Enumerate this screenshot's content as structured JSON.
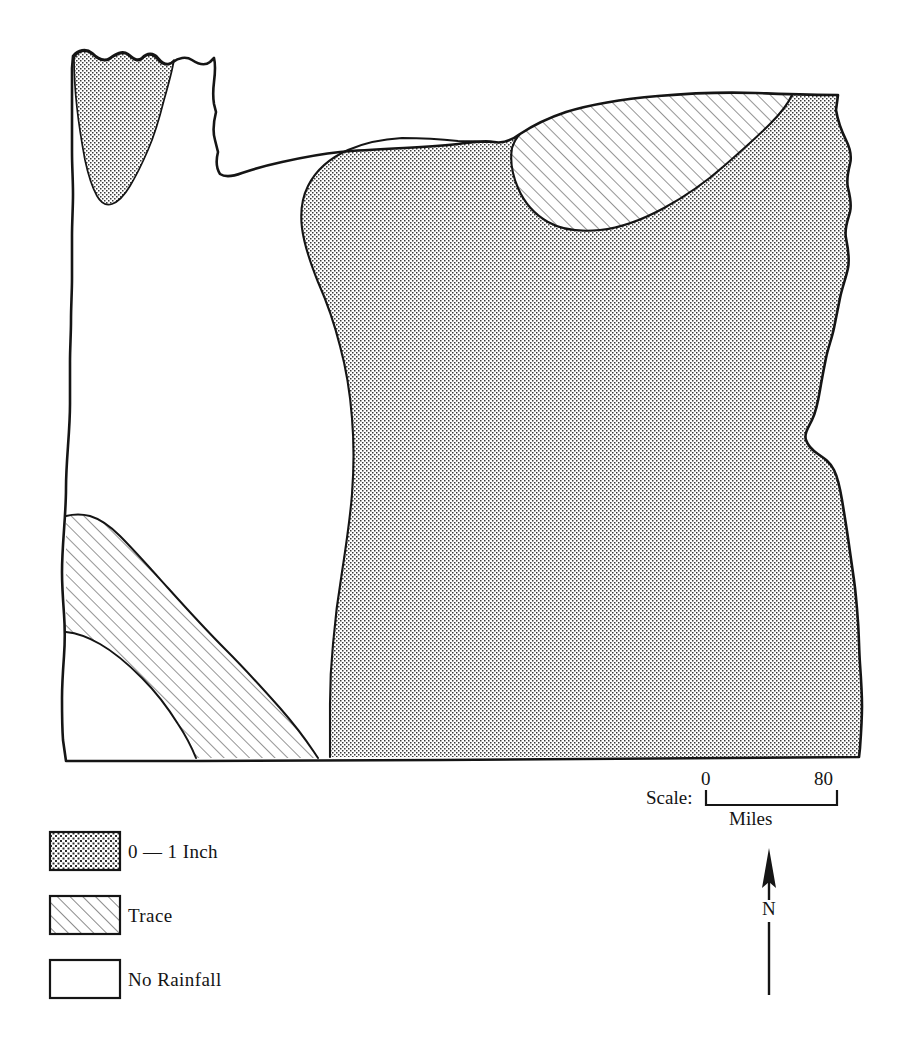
{
  "map": {
    "title": "Oregon Rainfall Distribution Map",
    "region_name": "Oregon",
    "outline_color": "#151515",
    "background_color": "#ffffff",
    "regions": [
      {
        "name": "northwest-coastal-stipple",
        "class_label": "0 — 1 Inch",
        "pattern": "stipple"
      },
      {
        "name": "eastern-oregon-stipple",
        "class_label": "0 — 1 Inch",
        "pattern": "stipple"
      },
      {
        "name": "northeast-trace-lens",
        "class_label": "Trace",
        "pattern": "hatch"
      },
      {
        "name": "southwest-trace-band",
        "class_label": "Trace",
        "pattern": "hatch"
      },
      {
        "name": "western-valley-no-rainfall",
        "class_label": "No Rainfall",
        "pattern": "blank"
      }
    ]
  },
  "legend": {
    "items": [
      {
        "label": "0 — 1 Inch",
        "pattern": "stipple"
      },
      {
        "label": "Trace",
        "pattern": "hatch"
      },
      {
        "label": "No Rainfall",
        "pattern": "blank"
      }
    ]
  },
  "scale": {
    "prefix": "Scale:",
    "min_label": "0",
    "max_label": "80",
    "units": "Miles"
  },
  "compass": {
    "direction_label": "N"
  }
}
